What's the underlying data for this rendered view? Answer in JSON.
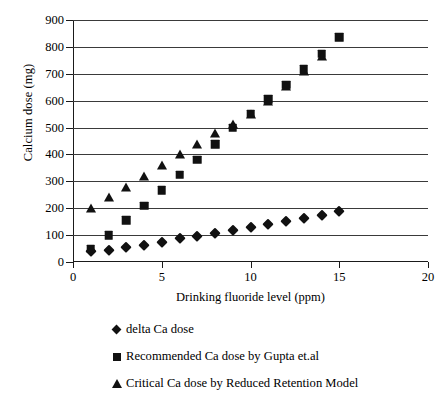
{
  "chart_data": {
    "type": "scatter",
    "title": "",
    "xlabel": "Drinking fluoride level (ppm)",
    "ylabel": "Calcium dose (mg)",
    "xlim": [
      0,
      20
    ],
    "ylim": [
      0,
      900
    ],
    "xticks": [
      0,
      5,
      10,
      15,
      20
    ],
    "yticks": [
      0,
      100,
      200,
      300,
      400,
      500,
      600,
      700,
      800,
      900
    ],
    "grid": "horizontal",
    "legend_position": "below",
    "marker_color": "#111111",
    "series": [
      {
        "name": "delta Ca dose",
        "marker": "diamond",
        "x": [
          1,
          2,
          3,
          4,
          5,
          6,
          7,
          8,
          9,
          10,
          11,
          12,
          13,
          14,
          15
        ],
        "values": [
          40,
          45,
          55,
          65,
          75,
          88,
          97,
          108,
          120,
          130,
          142,
          152,
          162,
          175,
          188
        ]
      },
      {
        "name": "Recommended Ca dose by Gupta et.al",
        "marker": "square",
        "x": [
          1,
          2,
          3,
          4,
          5,
          6,
          7,
          8,
          9,
          10,
          11,
          12,
          13,
          14,
          15
        ],
        "values": [
          50,
          100,
          155,
          210,
          268,
          325,
          380,
          438,
          500,
          552,
          605,
          660,
          718,
          775,
          835
        ]
      },
      {
        "name": "Critical Ca dose by Reduced Retention Model",
        "marker": "triangle",
        "x": [
          1,
          2,
          3,
          4,
          5,
          6,
          7,
          8,
          9,
          10,
          11,
          12,
          13,
          14
        ],
        "values": [
          200,
          240,
          280,
          320,
          360,
          400,
          440,
          478,
          512,
          552,
          600,
          655,
          712,
          765
        ]
      }
    ]
  },
  "legend": {
    "items": [
      {
        "label": "delta Ca dose",
        "marker": "diamond"
      },
      {
        "label": "Recommended Ca dose by Gupta et.al",
        "marker": "square"
      },
      {
        "label": "Critical Ca dose by Reduced Retention Model",
        "marker": "triangle"
      }
    ]
  }
}
